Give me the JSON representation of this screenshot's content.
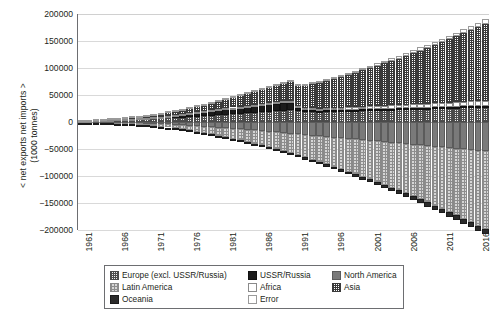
{
  "axes": {
    "y_title_line1": "< net exports net imports >",
    "y_title_line2": "(1000 tonnes)",
    "y_ticks": [
      "200000",
      "150000",
      "100000",
      "50000",
      "0",
      "-50000",
      "-100000",
      "-150000",
      "-200000"
    ],
    "x_ticks": [
      "1961",
      "1966",
      "1971",
      "1976",
      "1981",
      "1986",
      "1991",
      "1996",
      "2001",
      "2006",
      "2011",
      "2016"
    ]
  },
  "legend": {
    "rows": [
      [
        {
          "label": "Europe (excl. USSR/Russia)",
          "key": "europe"
        },
        {
          "label": "USSR/Russia",
          "key": "ussr"
        },
        {
          "label": "North America",
          "key": "northam"
        }
      ],
      [
        {
          "label": "Latin America",
          "key": "latin"
        },
        {
          "label": "Africa",
          "key": "africa"
        },
        {
          "label": "Asia",
          "key": "asia"
        }
      ],
      [
        {
          "label": "Oceania",
          "key": "oceania"
        },
        {
          "label": "Error",
          "key": "error"
        }
      ]
    ]
  },
  "chart_data": {
    "type": "bar",
    "stacked": true,
    "title": "",
    "xlabel": "",
    "ylabel": "< net exports net imports > (1000 tonnes)",
    "ylim": [
      -200000,
      200000
    ],
    "ytick_step": 50000,
    "grid": true,
    "legend_position": "bottom",
    "x": [
      1961,
      1962,
      1963,
      1964,
      1965,
      1966,
      1967,
      1968,
      1969,
      1970,
      1971,
      1972,
      1973,
      1974,
      1975,
      1976,
      1977,
      1978,
      1979,
      1980,
      1981,
      1982,
      1983,
      1984,
      1985,
      1986,
      1987,
      1988,
      1989,
      1990,
      1991,
      1992,
      1993,
      1994,
      1995,
      1996,
      1997,
      1998,
      1999,
      2000,
      2001,
      2002,
      2003,
      2004,
      2005,
      2006,
      2007,
      2008,
      2009,
      2010,
      2011,
      2012,
      2013,
      2014,
      2015,
      2016,
      2017
    ],
    "series": [
      {
        "name": "Europe (excl. USSR/Russia)",
        "values": [
          2100,
          2400,
          2700,
          3000,
          3400,
          3800,
          4200,
          4600,
          5000,
          5500,
          6000,
          6500,
          7100,
          7700,
          8300,
          9000,
          9700,
          10500,
          11300,
          12200,
          13100,
          14000,
          15000,
          16000,
          17000,
          18000,
          19000,
          20000,
          21000,
          21500,
          20000,
          19000,
          18500,
          18000,
          18500,
          19000,
          19500,
          20000,
          20500,
          21000,
          21500,
          22000,
          22500,
          23000,
          23500,
          24000,
          24500,
          25000,
          25500,
          26000,
          26500,
          27000,
          27500,
          28000,
          28500,
          29000,
          29500
        ]
      },
      {
        "name": "USSR/Russia",
        "values": [
          300,
          400,
          500,
          600,
          700,
          900,
          1100,
          1300,
          1600,
          2000,
          2400,
          2900,
          3500,
          4200,
          5000,
          5900,
          6900,
          8000,
          9200,
          10000,
          10500,
          11000,
          11500,
          12000,
          12500,
          13000,
          13500,
          14000,
          14500,
          14000,
          6000,
          4000,
          3500,
          3000,
          2800,
          2600,
          2500,
          2400,
          2300,
          2200,
          2100,
          2000,
          1900,
          1800,
          1700,
          1600,
          1500,
          1400,
          1300,
          1200,
          1100,
          1000,
          950,
          900,
          850,
          800,
          750
        ]
      },
      {
        "name": "North America",
        "values": [
          -800,
          -900,
          -1000,
          -1200,
          -1400,
          -1600,
          -1900,
          -2200,
          -2600,
          -3000,
          -3500,
          -4000,
          -4600,
          -5300,
          -6000,
          -6800,
          -7600,
          -8500,
          -9400,
          -10400,
          -11400,
          -12400,
          -13500,
          -14600,
          -15700,
          -16800,
          -18000,
          -19200,
          -20400,
          -21600,
          -22800,
          -24000,
          -25200,
          -26400,
          -27600,
          -28800,
          -30000,
          -31200,
          -32400,
          -33600,
          -34800,
          -36000,
          -37200,
          -38400,
          -39600,
          -40800,
          -42000,
          -43200,
          -44400,
          -45600,
          -46800,
          -48000,
          -49200,
          -50400,
          -51600,
          -52800,
          -54000
        ]
      },
      {
        "name": "Latin America",
        "values": [
          -500,
          -600,
          -700,
          -900,
          -1100,
          -1400,
          -1700,
          -2100,
          -2600,
          -3200,
          -3900,
          -4700,
          -5600,
          -6600,
          -7700,
          -8900,
          -10200,
          -11600,
          -13100,
          -14700,
          -16400,
          -18200,
          -20100,
          -22100,
          -24200,
          -26400,
          -28700,
          -31100,
          -33600,
          -36200,
          -38900,
          -41700,
          -44600,
          -47600,
          -50700,
          -53900,
          -57200,
          -60600,
          -64100,
          -67700,
          -71400,
          -75200,
          -79100,
          -83100,
          -87200,
          -91400,
          -95700,
          -100100,
          -104600,
          -109200,
          -113900,
          -118700,
          -123600,
          -128600,
          -133700,
          -138900,
          -144200
        ]
      },
      {
        "name": "Africa",
        "values": [
          200,
          230,
          260,
          300,
          340,
          390,
          440,
          500,
          560,
          630,
          700,
          780,
          860,
          950,
          1040,
          1140,
          1240,
          1350,
          1460,
          1580,
          1700,
          1830,
          1960,
          2100,
          2240,
          2390,
          2540,
          2700,
          2860,
          3030,
          3200,
          3380,
          3560,
          3750,
          3940,
          4140,
          4340,
          4550,
          4760,
          4980,
          5200,
          5430,
          5660,
          5900,
          6140,
          6390,
          6640,
          6900,
          7160,
          7430,
          7700,
          7980,
          8260,
          8550,
          8840,
          9140,
          9440
        ]
      },
      {
        "name": "Asia",
        "values": [
          900,
          1200,
          1500,
          1900,
          2300,
          2800,
          3300,
          3900,
          4500,
          5200,
          6000,
          6800,
          7700,
          8700,
          9700,
          10800,
          12000,
          13300,
          14700,
          16200,
          17800,
          19500,
          21300,
          23200,
          25200,
          27300,
          29500,
          31800,
          34200,
          36700,
          39300,
          42000,
          44800,
          47700,
          50700,
          53800,
          57000,
          60300,
          63700,
          67200,
          70800,
          74500,
          78300,
          82200,
          86200,
          90300,
          94500,
          98800,
          103200,
          107700,
          112300,
          117000,
          121800,
          126700,
          131700,
          136800,
          142000
        ]
      },
      {
        "name": "Oceania",
        "values": [
          -300,
          -340,
          -380,
          -430,
          -480,
          -540,
          -600,
          -670,
          -740,
          -820,
          -900,
          -990,
          -1080,
          -1180,
          -1280,
          -1390,
          -1500,
          -1620,
          -1740,
          -1870,
          -2000,
          -2140,
          -2280,
          -2430,
          -2580,
          -2740,
          -2900,
          -3070,
          -3240,
          -3420,
          -3600,
          -3790,
          -3980,
          -4180,
          -4380,
          -4590,
          -4800,
          -5020,
          -5240,
          -5470,
          -5700,
          -5940,
          -6180,
          -6430,
          -6680,
          -6940,
          -7200,
          -7470,
          -7740,
          -8020,
          -8300,
          -8590,
          -8880,
          -9180,
          -9480,
          -9790,
          -10100
        ]
      },
      {
        "name": "Error",
        "values": [
          100,
          120,
          140,
          160,
          190,
          220,
          250,
          290,
          330,
          380,
          430,
          490,
          550,
          620,
          690,
          770,
          850,
          940,
          1030,
          1130,
          1230,
          1340,
          1450,
          1570,
          1690,
          1820,
          1950,
          2090,
          2230,
          2380,
          2530,
          2690,
          2850,
          3020,
          3190,
          3370,
          3550,
          3740,
          3930,
          4130,
          4330,
          4540,
          4750,
          4970,
          5190,
          5420,
          5650,
          5890,
          6130,
          6380,
          6630,
          6890,
          7150,
          7420,
          7690,
          7970,
          8250
        ]
      }
    ]
  }
}
